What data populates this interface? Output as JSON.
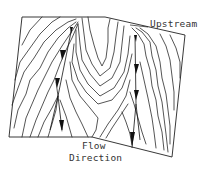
{
  "diagram": {
    "labels": {
      "upstream": "Upstream",
      "flow_line1": "Flow",
      "flow_line2": "Direction"
    },
    "colors": {
      "line": "#2a2a2a",
      "background": "#ffffff",
      "text": "#333333"
    },
    "flow_paths": [
      {
        "name": "left-flow-path",
        "arrows": 3
      },
      {
        "name": "right-flow-path",
        "arrows": 3
      }
    ]
  }
}
